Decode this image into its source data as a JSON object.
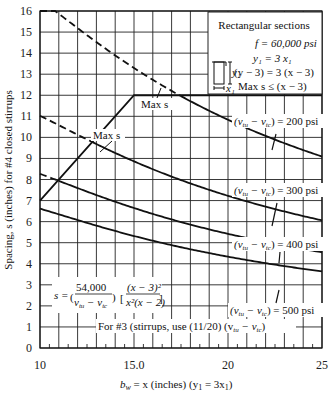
{
  "chart_data": {
    "type": "line",
    "title": "",
    "xlabel": "b_w = x (inches)  (y1 = 3x1)",
    "ylabel": "Spacing, s (inches) for #4 closed stirrups",
    "xlim": [
      10,
      25
    ],
    "ylim": [
      0,
      16
    ],
    "x_ticks": [
      "10",
      "15.0",
      "20",
      "25"
    ],
    "y_ticks": [
      "0",
      "1",
      "2",
      "3",
      "4",
      "5",
      "6",
      "7",
      "8",
      "9",
      "10",
      "11",
      "12",
      "13",
      "14",
      "15",
      "16"
    ],
    "grid": true,
    "formula": "s = (54,000 / (v_tu - v_tc)) [ (x - 3)^2 / (x^2 (x - 2)) ]",
    "series": [
      {
        "name": "(v_tu - v_tc) = 200 psi",
        "x": [
          10,
          12,
          14,
          16,
          18,
          20,
          22,
          25
        ],
        "values": [
          16.5,
          14.06,
          12.19,
          10.72,
          9.55,
          8.59,
          7.79,
          6.84
        ]
      },
      {
        "name": "(v_tu - v_tc) = 300 psi",
        "x": [
          10,
          12,
          14,
          16,
          18,
          20,
          22,
          25
        ],
        "values": [
          11.03,
          9.38,
          8.13,
          7.15,
          6.37,
          5.73,
          5.2,
          4.56
        ]
      },
      {
        "name": "(v_tu - v_tc) = 400 psi",
        "x": [
          10,
          12,
          14,
          16,
          18,
          20,
          22,
          25
        ],
        "values": [
          8.27,
          7.03,
          6.1,
          5.36,
          4.77,
          4.3,
          3.9,
          3.42
        ]
      },
      {
        "name": "(v_tu - v_tc) = 500 psi",
        "x": [
          10,
          12,
          14,
          16,
          18,
          20,
          22,
          25
        ],
        "values": [
          6.62,
          5.63,
          4.88,
          4.29,
          3.82,
          3.44,
          3.12,
          2.74
        ]
      },
      {
        "name": "Max s",
        "x": [
          10,
          15,
          25
        ],
        "values": [
          7,
          12,
          12
        ]
      }
    ],
    "annotations": [
      "Max s",
      "Max s",
      "For #3 (stirrups, use (11/20) (v_tu - v_tc)"
    ]
  },
  "labels": {
    "x_tick_10": "10",
    "x_tick_15": "15.0",
    "x_tick_20": "20",
    "x_tick_25": "25",
    "xlabel_a": "b",
    "xlabel_sub": "w",
    "xlabel_b": " = x (inches)  (y",
    "xlabel_sub2": "1",
    "xlabel_c": " = 3x",
    "xlabel_sub3": "1",
    "xlabel_d": ")",
    "ylabel": "Spacing, s (inches) for #4 closed stirrups",
    "max_s_1": "Max s",
    "max_s_2": "Max s",
    "curve_200": "(vₜᵤ − vₜₑ) = 200 psi",
    "curve_200_txt": "= 200 psi",
    "curve_300_txt": "= 300 psi",
    "curve_400_txt": "= 400 psi",
    "curve_500_txt": "= 500 psi",
    "vt_open": "(v",
    "tu": "tu",
    "minus": " − v",
    "tc": "tc",
    "close": ")",
    "footer_note_a": "For #3 (stirrups, use (11/20) (v",
    "footer_note_b": "tu",
    "footer_note_c": " − v",
    "footer_note_d": "tc",
    "footer_note_e": ")",
    "formula_s": "s =",
    "formula_num": "54,000",
    "formula_num2": "(x − 3)²",
    "formula_den2": "x²(x − 2)"
  },
  "legend_box": {
    "title": "Rectangular sections",
    "line1": "f  = 60,000 psi",
    "line1_sub": "y",
    "line2": "y₁ = 3 x₁",
    "line3": "(y − 3) = 3 (x − 3)",
    "line4": "Max s ≤ (x − 3)",
    "diagram_label_4": "#4",
    "diagram_y1": "y₁",
    "diagram_x1": "x₁"
  }
}
